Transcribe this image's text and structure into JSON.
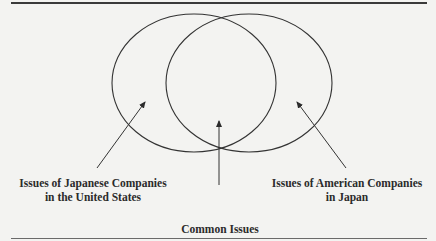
{
  "diagram": {
    "type": "venn",
    "sets": [
      {
        "id": "left",
        "label_lines": [
          "Issues of Japanese Companies",
          "in the United States"
        ]
      },
      {
        "id": "right",
        "label_lines": [
          "Issues of American Companies",
          "in Japan"
        ]
      }
    ],
    "intersection": {
      "label": "Common Issues"
    },
    "colors": {
      "stroke": "#333333",
      "text": "#2b2b2b",
      "background": "#f3f3f1"
    }
  }
}
